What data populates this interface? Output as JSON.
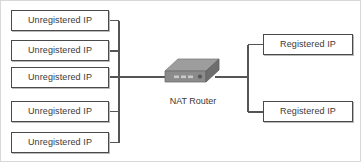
{
  "diagram": {
    "type": "network-topology",
    "background_color": "#ffffff",
    "frame_color": "#d8d8d8",
    "line_color": "#555555",
    "box_border_color": "#4a4a4a",
    "text_color": "#3a3a3a",
    "router_color_top": "#9a9a9a",
    "router_color_front": "#8a8a8a",
    "router_color_side": "#6e6e6e"
  },
  "left_nodes": [
    {
      "label": "Unregistered IP"
    },
    {
      "label": "Unregistered IP"
    },
    {
      "label": "Unregistered IP"
    },
    {
      "label": "Unregistered IP"
    },
    {
      "label": "Unregistered IP"
    }
  ],
  "router": {
    "label": "NAT Router",
    "icon": "router-icon"
  },
  "right_nodes": [
    {
      "label": "Registered IP"
    },
    {
      "label": "Registered IP"
    }
  ]
}
